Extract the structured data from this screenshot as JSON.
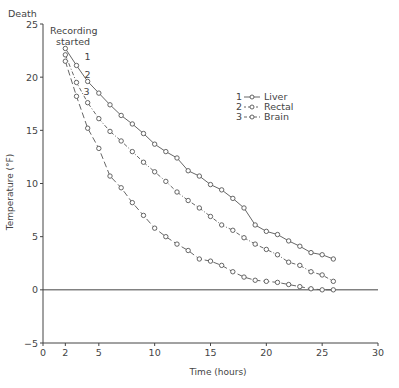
{
  "chart_data": {
    "type": "line",
    "title": "",
    "xlabel": "Time (hours)",
    "ylabel": "Temperature (°F)",
    "xlim": [
      0,
      30
    ],
    "ylim": [
      -5,
      25
    ],
    "xticks": [
      0,
      2,
      5,
      10,
      15,
      20,
      25,
      30
    ],
    "yticks": [
      -5,
      0,
      5,
      10,
      15,
      20,
      25
    ],
    "xtick_labels": [
      "0",
      "2",
      "5",
      "10",
      "15",
      "20",
      "25",
      "30"
    ],
    "ytick_labels": [
      "−5",
      "0",
      "5",
      "10",
      "15",
      "20",
      "25"
    ],
    "grid": false,
    "reference_line_y": 0,
    "legend_position": "upper-right",
    "annotations": {
      "death": "Death",
      "recording_line1": "Recording",
      "recording_line2": "started"
    },
    "x": [
      2,
      3,
      4,
      5,
      6,
      7,
      8,
      9,
      10,
      11,
      12,
      13,
      14,
      15,
      16,
      17,
      18,
      19,
      20,
      21,
      22,
      23,
      24,
      25,
      26
    ],
    "series": [
      {
        "name": "Liver",
        "number": "1",
        "legend_label": "1 —o— Liver",
        "style": "solid",
        "values": [
          22.7,
          21.1,
          19.6,
          18.5,
          17.4,
          16.4,
          15.6,
          14.7,
          13.7,
          13.0,
          12.4,
          11.2,
          10.7,
          9.9,
          9.4,
          8.6,
          7.7,
          6.1,
          5.5,
          5.2,
          4.6,
          4.1,
          3.5,
          3.3,
          2.9
        ]
      },
      {
        "name": "Rectal",
        "number": "2",
        "legend_label": "2 -o- Rectal",
        "style": "dashdot",
        "values": [
          22.1,
          19.5,
          17.6,
          16.1,
          14.9,
          14.0,
          13.0,
          12.0,
          11.1,
          10.2,
          9.2,
          8.4,
          7.7,
          6.9,
          6.1,
          5.6,
          4.9,
          4.3,
          3.8,
          3.3,
          2.6,
          2.3,
          1.7,
          1.4,
          0.8
        ]
      },
      {
        "name": "Brain",
        "number": "3",
        "legend_label": "3 -o— Brain",
        "style": "dashed",
        "values": [
          21.5,
          18.2,
          15.2,
          13.3,
          10.7,
          9.6,
          8.2,
          7.0,
          5.8,
          5.0,
          4.3,
          3.7,
          2.9,
          2.7,
          2.3,
          1.7,
          1.2,
          0.9,
          0.8,
          0.7,
          0.5,
          0.3,
          0.1,
          0.0,
          0.0
        ]
      }
    ],
    "colors": {
      "line": "#555555",
      "axis": "#444444"
    }
  }
}
